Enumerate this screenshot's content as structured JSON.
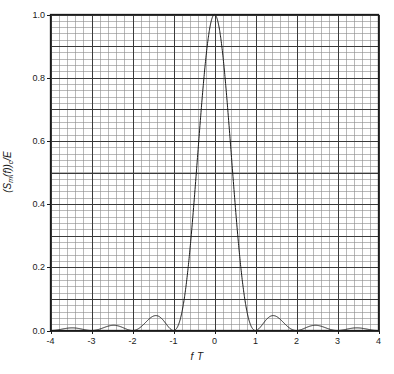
{
  "chart_data": {
    "type": "line",
    "title": "",
    "subtitle": "",
    "xlabel": "f T",
    "ylabel": "(Sm(f))c /E",
    "ylabel_parts": {
      "open": "(S",
      "sub1": "m",
      "mid": "(f))",
      "sub2": "c",
      "tail": "/E"
    },
    "xlim": [
      -4,
      4
    ],
    "ylim": [
      0,
      1.0
    ],
    "xticks": [
      -4,
      -3,
      -2,
      -1,
      0,
      1,
      2,
      3,
      4
    ],
    "xtick_labels": [
      "-4",
      "-3",
      "-2",
      "-1",
      "0",
      "1",
      "2",
      "3",
      "4"
    ],
    "yticks": [
      0.0,
      0.2,
      0.4,
      0.6,
      0.8,
      1.0
    ],
    "ytick_labels": [
      "0.0",
      "0.2",
      "0.4",
      "0.6",
      "0.8",
      "1.0"
    ],
    "grid": true,
    "grid_major_x_step": 1,
    "grid_minor_x_step": 0.2,
    "grid_major_y_step": 0.1,
    "grid_minor_y_step": 0.02,
    "legend": null,
    "legend_position": "none",
    "series": [
      {
        "name": "(Sm(f))c /E",
        "function": "sinc_squared",
        "color": "#1a1a1a",
        "linewidth": 1,
        "x": [
          -4.0,
          -3.9,
          -3.8,
          -3.7,
          -3.6,
          -3.5,
          -3.4,
          -3.3,
          -3.2,
          -3.1,
          -3.0,
          -2.9,
          -2.8,
          -2.7,
          -2.6,
          -2.5,
          -2.4,
          -2.3,
          -2.2,
          -2.1,
          -2.0,
          -1.9,
          -1.8,
          -1.7,
          -1.6,
          -1.5,
          -1.4,
          -1.3,
          -1.2,
          -1.1,
          -1.0,
          -0.9,
          -0.8,
          -0.7,
          -0.6,
          -0.5,
          -0.4,
          -0.3,
          -0.2,
          -0.1,
          0.0,
          0.1,
          0.2,
          0.3,
          0.4,
          0.5,
          0.6,
          0.7,
          0.8,
          0.9,
          1.0,
          1.1,
          1.2,
          1.3,
          1.4,
          1.5,
          1.6,
          1.7,
          1.8,
          1.9,
          2.0,
          2.1,
          2.2,
          2.3,
          2.4,
          2.5,
          2.6,
          2.7,
          2.8,
          2.9,
          3.0,
          3.1,
          3.2,
          3.3,
          3.4,
          3.5,
          3.6,
          3.7,
          3.8,
          3.9,
          4.0
        ],
        "y": [
          0.0,
          0.0024,
          0.0069,
          0.0101,
          0.0096,
          0.0064,
          0.0027,
          0.0004,
          0.0002,
          0.0018,
          0.0,
          0.0036,
          0.0113,
          0.0173,
          0.0171,
          0.0117,
          0.0051,
          0.0008,
          0.0004,
          0.0032,
          0.0,
          0.0073,
          0.0239,
          0.0383,
          0.0394,
          0.0279,
          0.0125,
          0.0021,
          0.0011,
          0.0086,
          0.0,
          0.0243,
          0.0875,
          0.1543,
          0.1744,
          0.4053,
          0.6366,
          0.8269,
          0.9549,
          0.9959,
          1.0,
          0.9959,
          0.9549,
          0.8269,
          0.6366,
          0.4053,
          0.1744,
          0.1543,
          0.0875,
          0.0243,
          0.0,
          0.0086,
          0.0011,
          0.0021,
          0.0125,
          0.0279,
          0.0394,
          0.0383,
          0.0239,
          0.0073,
          0.0,
          0.0032,
          0.0004,
          0.0008,
          0.0051,
          0.0117,
          0.0171,
          0.0173,
          0.0113,
          0.0036,
          0.0,
          0.0018,
          0.0002,
          0.0004,
          0.0027,
          0.0064,
          0.0096,
          0.0101,
          0.0069,
          0.0024,
          0.0
        ],
        "peak": {
          "x": 0,
          "y": 1.0
        },
        "nulls": [
          -3,
          -2,
          -1,
          1,
          2,
          3
        ],
        "sidelobe_peaks": [
          {
            "x": -3.47,
            "y": 0.0104
          },
          {
            "x": -2.46,
            "y": 0.018
          },
          {
            "x": -1.43,
            "y": 0.0472
          },
          {
            "x": 1.43,
            "y": 0.0472
          },
          {
            "x": 2.46,
            "y": 0.018
          },
          {
            "x": 3.47,
            "y": 0.0104
          }
        ]
      }
    ]
  },
  "axes": {
    "frame_color": "#1a1a1a",
    "major_grid_color": "#3a3a3a",
    "minor_grid_color": "#8a8a8a",
    "background": "#ffffff"
  }
}
